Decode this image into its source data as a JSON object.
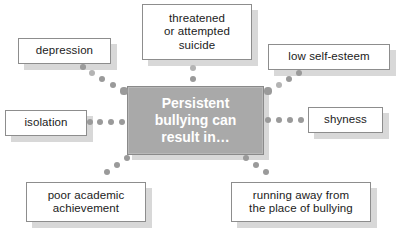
{
  "diagram": {
    "type": "hub-and-spoke concept map",
    "hub": {
      "label": "Persistent bullying can result in...",
      "lines": [
        "Persistent",
        "bullying can",
        "result in…"
      ],
      "fill": "#a9a9a9",
      "text_color": "#ffffff",
      "border": "#8a8a8a",
      "x": 127,
      "y": 86,
      "w": 137,
      "h": 69
    },
    "connector": {
      "color": "#9a9a9a",
      "light_color": "#b4b4b4",
      "style": "dotted"
    },
    "node_style": {
      "fill": "#ffffff",
      "border": "#8d8d8d",
      "shadow": "#d8d8d8",
      "text_color": "#1b1b1b"
    },
    "nodes": [
      {
        "id": "threatened-or-attempted-suicide",
        "label": "threatened or attempted suicide",
        "lines": [
          "threatened",
          "or attempted",
          "suicide"
        ],
        "x": 142,
        "y": 4,
        "w": 110,
        "h": 56,
        "position": "top"
      },
      {
        "id": "depression",
        "label": "depression",
        "lines": [
          "depression"
        ],
        "x": 18,
        "y": 38,
        "w": 93,
        "h": 26,
        "position": "top-left"
      },
      {
        "id": "low-self-esteem",
        "label": "low self-esteem",
        "lines": [
          "low self-esteem"
        ],
        "x": 268,
        "y": 44,
        "w": 122,
        "h": 26,
        "position": "top-right"
      },
      {
        "id": "isolation",
        "label": "isolation",
        "lines": [
          "isolation"
        ],
        "x": 5,
        "y": 110,
        "w": 82,
        "h": 26,
        "position": "left"
      },
      {
        "id": "shyness",
        "label": "shyness",
        "lines": [
          "shyness"
        ],
        "x": 308,
        "y": 107,
        "w": 75,
        "h": 26,
        "position": "right"
      },
      {
        "id": "poor-academic-achievement",
        "label": "poor academic achievement",
        "lines": [
          "poor academic",
          "achievement"
        ],
        "x": 26,
        "y": 182,
        "w": 120,
        "h": 40,
        "position": "bottom-left"
      },
      {
        "id": "running-away-from-the-place-of-bullying",
        "label": "running away from the place of bullying",
        "lines": [
          "running away from",
          "the place of bullying"
        ],
        "x": 231,
        "y": 182,
        "w": 140,
        "h": 40,
        "position": "bottom-right"
      }
    ],
    "connectors": [
      {
        "from": "hub",
        "to": "threatened-or-attempted-suicide",
        "dots": [
          {
            "x": 193,
            "y": 79,
            "r": 3.2,
            "light": false
          },
          {
            "x": 193,
            "y": 68,
            "r": 3.0,
            "light": true
          }
        ]
      },
      {
        "from": "hub",
        "to": "depression",
        "dots": [
          {
            "x": 124,
            "y": 91,
            "r": 3.6,
            "light": false
          },
          {
            "x": 113,
            "y": 85,
            "r": 3.4,
            "light": false
          },
          {
            "x": 102,
            "y": 79,
            "r": 3.2,
            "light": false
          },
          {
            "x": 92,
            "y": 73,
            "r": 3.0,
            "light": true
          },
          {
            "x": 83,
            "y": 67,
            "r": 2.8,
            "light": false
          }
        ]
      },
      {
        "from": "hub",
        "to": "low-self-esteem",
        "dots": [
          {
            "x": 268,
            "y": 91,
            "r": 3.6,
            "light": false
          },
          {
            "x": 279,
            "y": 85,
            "r": 3.2,
            "light": true
          },
          {
            "x": 289,
            "y": 79,
            "r": 3.2,
            "light": false
          },
          {
            "x": 299,
            "y": 73,
            "r": 3.0,
            "light": false
          }
        ]
      },
      {
        "from": "hub",
        "to": "isolation",
        "dots": [
          {
            "x": 122,
            "y": 122,
            "r": 3.4,
            "light": false
          },
          {
            "x": 111,
            "y": 122,
            "r": 3.2,
            "light": false
          },
          {
            "x": 100,
            "y": 122,
            "r": 3.2,
            "light": false
          },
          {
            "x": 90,
            "y": 122,
            "r": 3.0,
            "light": false
          }
        ]
      },
      {
        "from": "hub",
        "to": "shyness",
        "dots": [
          {
            "x": 268,
            "y": 120,
            "r": 3.4,
            "light": false
          },
          {
            "x": 279,
            "y": 120,
            "r": 3.2,
            "light": false
          },
          {
            "x": 290,
            "y": 120,
            "r": 3.2,
            "light": false
          },
          {
            "x": 301,
            "y": 120,
            "r": 3.0,
            "light": false
          }
        ]
      },
      {
        "from": "hub",
        "to": "poor-academic-achievement",
        "dots": [
          {
            "x": 127,
            "y": 158,
            "r": 3.4,
            "light": false
          },
          {
            "x": 117,
            "y": 165,
            "r": 3.2,
            "light": false
          },
          {
            "x": 107,
            "y": 172,
            "r": 3.0,
            "light": false
          }
        ]
      },
      {
        "from": "hub",
        "to": "running-away-from-the-place-of-bullying",
        "dots": [
          {
            "x": 246,
            "y": 158,
            "r": 3.4,
            "light": false
          },
          {
            "x": 256,
            "y": 165,
            "r": 3.2,
            "light": false
          },
          {
            "x": 266,
            "y": 172,
            "r": 3.0,
            "light": false
          }
        ]
      }
    ]
  }
}
